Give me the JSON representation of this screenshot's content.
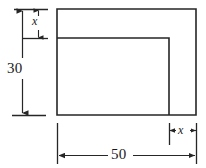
{
  "figure": {
    "stroke_color": "#262626",
    "background_color": "#ffffff",
    "labels": {
      "height_total": "30",
      "width_total": "50",
      "inset_top": "x",
      "inset_right": "x"
    },
    "shapes": {
      "outer_rect": {
        "name": "outer-rectangle",
        "x": 57,
        "y": 9,
        "width": 139,
        "height": 106
      },
      "inner_rect": {
        "name": "inner-rectangle",
        "x": 57,
        "y": 38,
        "width": 112,
        "height": 77
      }
    },
    "dimensions": [
      {
        "name": "overall-height",
        "value": "30",
        "orientation": "vertical",
        "from": 9,
        "to": 115
      },
      {
        "name": "overall-width",
        "value": "50",
        "orientation": "horizontal",
        "from": 57,
        "to": 196
      },
      {
        "name": "top-offset",
        "value": "x",
        "orientation": "vertical",
        "from": 9,
        "to": 38
      },
      {
        "name": "right-offset",
        "value": "x",
        "orientation": "horizontal",
        "from": 169,
        "to": 196
      }
    ]
  }
}
